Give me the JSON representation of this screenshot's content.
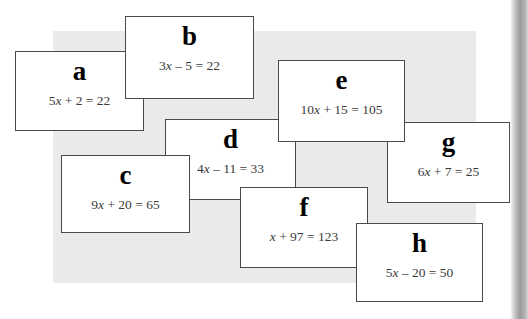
{
  "page": {
    "background_color": "#ffffff",
    "panel_color": "#eaeaea",
    "card_border_color": "#4a4a4a",
    "card_background_color": "#ffffff"
  },
  "cards": [
    {
      "id": "card-a",
      "letter": "a",
      "equation": "5x + 2 = 22",
      "equation_parts": {
        "coefficient": "5",
        "variable": "x",
        "operator": "+",
        "constant": "2",
        "equals": "=",
        "result": "22"
      },
      "x": 15,
      "y": 51,
      "width": 129,
      "height": 80,
      "z": 3
    },
    {
      "id": "card-b",
      "letter": "b",
      "equation": "3x – 5 = 22",
      "equation_parts": {
        "coefficient": "3",
        "variable": "x",
        "operator": "–",
        "constant": "5",
        "equals": "=",
        "result": "22"
      },
      "x": 125,
      "y": 16,
      "width": 129,
      "height": 83,
      "z": 4
    },
    {
      "id": "card-c",
      "letter": "c",
      "equation": "9x + 20 = 65",
      "equation_parts": {
        "coefficient": "9",
        "variable": "x",
        "operator": "+",
        "constant": "20",
        "equals": "=",
        "result": "65"
      },
      "x": 61,
      "y": 155,
      "width": 129,
      "height": 78,
      "z": 5
    },
    {
      "id": "card-d",
      "letter": "d",
      "equation": "4x – 11 = 33",
      "equation_parts": {
        "coefficient": "4",
        "variable": "x",
        "operator": "–",
        "constant": "11",
        "equals": "=",
        "result": "33"
      },
      "x": 165,
      "y": 119,
      "width": 131,
      "height": 81,
      "z": 2
    },
    {
      "id": "card-e",
      "letter": "e",
      "equation": "10x + 15 = 105",
      "equation_parts": {
        "coefficient": "10",
        "variable": "x",
        "operator": "+",
        "constant": "15",
        "equals": "=",
        "result": "105"
      },
      "x": 278,
      "y": 60,
      "width": 127,
      "height": 82,
      "z": 4
    },
    {
      "id": "card-f",
      "letter": "f",
      "equation": "x + 97 = 123",
      "equation_parts": {
        "coefficient": "",
        "variable": "x",
        "operator": "+",
        "constant": "97",
        "equals": "=",
        "result": "123"
      },
      "x": 240,
      "y": 187,
      "width": 128,
      "height": 81,
      "z": 5
    },
    {
      "id": "card-g",
      "letter": "g",
      "equation": "6x + 7 = 25",
      "equation_parts": {
        "coefficient": "6",
        "variable": "x",
        "operator": "+",
        "constant": "7",
        "equals": "=",
        "result": "25"
      },
      "x": 387,
      "y": 122,
      "width": 123,
      "height": 81,
      "z": 3
    },
    {
      "id": "card-h",
      "letter": "h",
      "equation": "5x – 20 = 50",
      "equation_parts": {
        "coefficient": "5",
        "variable": "x",
        "operator": "–",
        "constant": "20",
        "equals": "=",
        "result": "50"
      },
      "x": 356,
      "y": 223,
      "width": 127,
      "height": 79,
      "z": 6
    }
  ]
}
